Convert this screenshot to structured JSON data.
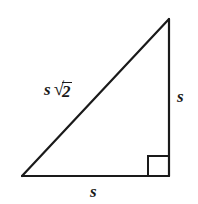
{
  "figure": {
    "kind": "geometry-diagram",
    "shape": "right-triangle",
    "background_color": "#ffffff",
    "stroke_color": "#1a1a1a",
    "stroke_width": 2.2,
    "labels": {
      "hypotenuse": {
        "variable": "s",
        "radical_sign": "√",
        "radicand": "2",
        "full_text": "s√2"
      },
      "right_leg": "s",
      "bottom_leg": "s"
    },
    "right_angle_marker": {
      "present": true,
      "vertex": "bottom-right",
      "size": 20
    },
    "vertices": {
      "apex": [
        169,
        19
      ],
      "bottom_left": [
        22,
        176
      ],
      "bottom_right": [
        169,
        176
      ]
    }
  }
}
